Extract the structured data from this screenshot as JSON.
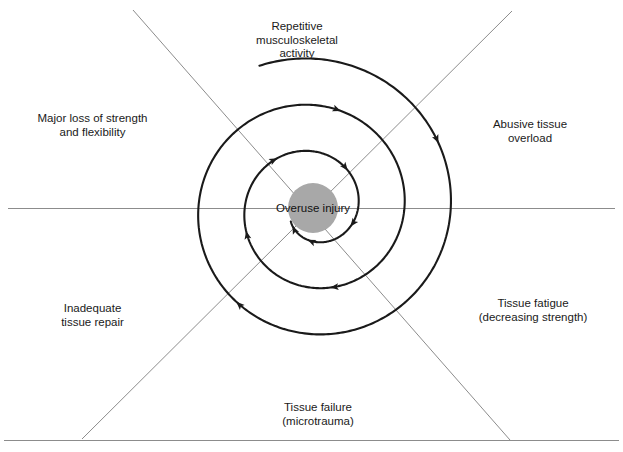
{
  "diagram": {
    "type": "cyclic-spiral",
    "center_label": "Overuse injury",
    "stages": [
      {
        "id": "repetitive-activity",
        "lines": [
          "Repetitive",
          "musculoskeletal",
          "activity"
        ],
        "position": "top"
      },
      {
        "id": "abusive-tissue-overload",
        "lines": [
          "Abusive tissue",
          "overload"
        ],
        "position": "right-upper"
      },
      {
        "id": "tissue-fatigue",
        "lines": [
          "Tissue fatigue",
          "(decreasing strength)"
        ],
        "position": "right-lower"
      },
      {
        "id": "tissue-failure",
        "lines": [
          "Tissue failure",
          "(microtrauma)"
        ],
        "position": "bottom"
      },
      {
        "id": "inadequate-tissue-repair",
        "lines": [
          "Inadequate",
          "tissue repair"
        ],
        "position": "left-lower"
      },
      {
        "id": "major-loss-of-strength",
        "lines": [
          "Major loss of strength",
          "and flexibility"
        ],
        "position": "left-upper"
      }
    ],
    "colors": {
      "spiral_stroke": "#1a1a1a",
      "axis_line": "#8c8c8c",
      "center_fill": "#a8a8a8",
      "text": "#1a1a1a",
      "background": "#ffffff"
    }
  }
}
